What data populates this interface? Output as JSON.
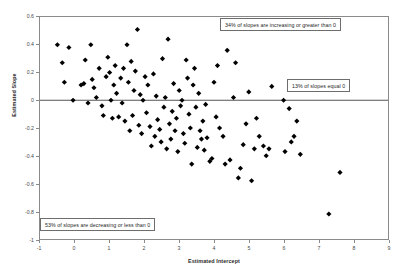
{
  "chart_data": {
    "type": "scatter",
    "title": "",
    "xlabel": "Estimated Intercept",
    "ylabel": "Estimated Slope",
    "xlim": [
      -1,
      9
    ],
    "ylim": [
      -1,
      0.6
    ],
    "xticks": [
      -1,
      0,
      1,
      2,
      3,
      4,
      5,
      6,
      7,
      8,
      9
    ],
    "xtick_labels": [
      "-1",
      "0",
      "1",
      "2",
      "3",
      "4",
      "5",
      "6",
      "7",
      "8",
      "9"
    ],
    "yticks": [
      0.6,
      0.4,
      0.2,
      0,
      -0.2,
      -0.4,
      -0.6,
      -0.8,
      -1
    ],
    "ytick_labels": [
      "0.6",
      "0.4",
      "0.2",
      "0",
      "-0.2",
      "-0.4",
      "-0.6",
      "-0.8",
      "-1"
    ],
    "grid": false,
    "legend": null,
    "marker": "diamond",
    "marker_color": "#000000",
    "marker_size": 4,
    "reference_lines": [
      {
        "name": "zero-slope-line",
        "orientation": "horizontal",
        "y": 0,
        "color": "#555555"
      }
    ],
    "series": [
      {
        "name": "slope-vs-intercept",
        "points": [
          [
            -0.5,
            0.4
          ],
          [
            -0.36,
            0.27
          ],
          [
            -0.3,
            0.13
          ],
          [
            -0.17,
            0.38
          ],
          [
            -0.05,
            0.0
          ],
          [
            0.18,
            0.11
          ],
          [
            0.26,
            0.12
          ],
          [
            0.3,
            0.29
          ],
          [
            0.38,
            -0.02
          ],
          [
            0.46,
            0.4
          ],
          [
            0.5,
            0.15
          ],
          [
            0.55,
            0.09
          ],
          [
            0.62,
            0.02
          ],
          [
            0.7,
            0.23
          ],
          [
            0.78,
            -0.04
          ],
          [
            0.82,
            -0.11
          ],
          [
            0.9,
            0.17
          ],
          [
            0.95,
            0.31
          ],
          [
            1.0,
            0.2
          ],
          [
            1.04,
            0.0
          ],
          [
            1.08,
            -0.13
          ],
          [
            1.12,
            0.11
          ],
          [
            1.16,
            0.25
          ],
          [
            1.2,
            0.05
          ],
          [
            1.26,
            -0.12
          ],
          [
            1.32,
            0.16
          ],
          [
            1.36,
            -0.02
          ],
          [
            1.4,
            0.23
          ],
          [
            1.44,
            -0.15
          ],
          [
            1.5,
            0.4
          ],
          [
            1.54,
            0.13
          ],
          [
            1.58,
            -0.22
          ],
          [
            1.62,
            0.28
          ],
          [
            1.66,
            -0.11
          ],
          [
            1.7,
            0.07
          ],
          [
            1.74,
            0.21
          ],
          [
            1.8,
            0.51
          ],
          [
            1.84,
            -0.18
          ],
          [
            1.88,
            0.04
          ],
          [
            1.92,
            -0.24
          ],
          [
            1.96,
            0.0
          ],
          [
            2.02,
            0.17
          ],
          [
            2.06,
            -0.09
          ],
          [
            2.1,
            0.11
          ],
          [
            2.16,
            -0.19
          ],
          [
            2.2,
            -0.33
          ],
          [
            2.26,
            0.19
          ],
          [
            2.3,
            -0.26
          ],
          [
            2.34,
            0.03
          ],
          [
            2.38,
            -0.14
          ],
          [
            2.44,
            -0.21
          ],
          [
            2.48,
            -0.3
          ],
          [
            2.52,
            0.3
          ],
          [
            2.56,
            -0.05
          ],
          [
            2.6,
            0.02
          ],
          [
            2.64,
            -0.35
          ],
          [
            2.68,
            0.44
          ],
          [
            2.72,
            -0.17
          ],
          [
            2.76,
            -0.28
          ],
          [
            2.8,
            -0.08
          ],
          [
            2.84,
            0.12
          ],
          [
            2.88,
            -0.22
          ],
          [
            2.92,
            -0.13
          ],
          [
            2.96,
            -0.37
          ],
          [
            3.0,
            0.07
          ],
          [
            3.04,
            -0.04
          ],
          [
            3.08,
            0.0
          ],
          [
            3.12,
            -0.24
          ],
          [
            3.16,
            -0.31
          ],
          [
            3.2,
            0.29
          ],
          [
            3.24,
            0.16
          ],
          [
            3.28,
            -0.1
          ],
          [
            3.32,
            -0.2
          ],
          [
            3.36,
            -0.46
          ],
          [
            3.4,
            0.11
          ],
          [
            3.44,
            0.23
          ],
          [
            3.48,
            -0.05
          ],
          [
            3.52,
            -0.34
          ],
          [
            3.56,
            0.05
          ],
          [
            3.6,
            -0.22
          ],
          [
            3.64,
            -0.28
          ],
          [
            3.68,
            -0.15
          ],
          [
            3.72,
            -0.36
          ],
          [
            3.76,
            -0.03
          ],
          [
            3.8,
            -0.27
          ],
          [
            3.88,
            -0.44
          ],
          [
            3.94,
            -0.42
          ],
          [
            4.0,
            0.13
          ],
          [
            4.06,
            -0.12
          ],
          [
            4.1,
            0.25
          ],
          [
            4.16,
            -0.2
          ],
          [
            4.26,
            -0.26
          ],
          [
            4.32,
            -0.46
          ],
          [
            4.38,
            0.36
          ],
          [
            4.46,
            -0.43
          ],
          [
            4.56,
            0.02
          ],
          [
            4.62,
            0.27
          ],
          [
            4.7,
            -0.56
          ],
          [
            4.76,
            -0.49
          ],
          [
            4.84,
            -0.32
          ],
          [
            4.92,
            -0.17
          ],
          [
            5.0,
            0.06
          ],
          [
            5.08,
            -0.58
          ],
          [
            5.16,
            -0.35
          ],
          [
            5.22,
            -0.13
          ],
          [
            5.3,
            -0.26
          ],
          [
            5.42,
            -0.33
          ],
          [
            5.5,
            -0.4
          ],
          [
            5.58,
            -0.35
          ],
          [
            5.66,
            0.1
          ],
          [
            6.0,
            0.0
          ],
          [
            6.04,
            -0.37
          ],
          [
            6.16,
            -0.06
          ],
          [
            6.22,
            -0.3
          ],
          [
            6.3,
            -0.26
          ],
          [
            6.38,
            -0.15
          ],
          [
            6.48,
            -0.39
          ],
          [
            7.3,
            -0.82
          ],
          [
            7.62,
            -0.52
          ]
        ]
      }
    ],
    "annotations": [
      {
        "name": "increasing",
        "text": "34% of slopes are increasing or greater than 0"
      },
      {
        "name": "equal",
        "text": "13% of slopes equal 0"
      },
      {
        "name": "decreasing",
        "text": "53% of slopes are decreasing or less than 0"
      }
    ]
  }
}
